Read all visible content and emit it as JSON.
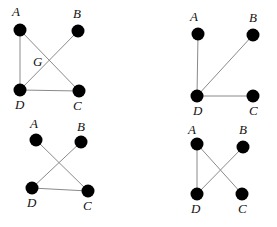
{
  "diagram": {
    "type": "graph-panels",
    "colors": {
      "node": "#000000",
      "edge": "#8a8a8a",
      "label": "#111111",
      "background": "#ffffff"
    },
    "panels": [
      {
        "id": "panel-1",
        "nodes": [
          {
            "id": "A",
            "label": "A",
            "x": 20,
            "y": 30,
            "lx": 12,
            "ly": 16
          },
          {
            "id": "B",
            "label": "B",
            "x": 78,
            "y": 31,
            "lx": 73,
            "ly": 18
          },
          {
            "id": "D",
            "label": "D",
            "x": 20,
            "y": 90,
            "lx": 15,
            "ly": 109
          },
          {
            "id": "C",
            "label": "C",
            "x": 79,
            "y": 91,
            "lx": 73,
            "ly": 110
          }
        ],
        "edges": [
          [
            "A",
            "D"
          ],
          [
            "A",
            "C"
          ],
          [
            "B",
            "D"
          ],
          [
            "D",
            "C"
          ]
        ],
        "extra_labels": [
          {
            "text": "G",
            "x": 33,
            "y": 66
          }
        ]
      },
      {
        "id": "panel-2",
        "nodes": [
          {
            "id": "A",
            "label": "A",
            "x": 198,
            "y": 34,
            "lx": 190,
            "ly": 21
          },
          {
            "id": "B",
            "label": "B",
            "x": 253,
            "y": 35,
            "lx": 249,
            "ly": 22
          },
          {
            "id": "D",
            "label": "D",
            "x": 197,
            "y": 96,
            "lx": 193,
            "ly": 115
          },
          {
            "id": "C",
            "label": "C",
            "x": 253,
            "y": 96,
            "lx": 249,
            "ly": 115
          }
        ],
        "edges": [
          [
            "A",
            "D"
          ],
          [
            "B",
            "D"
          ],
          [
            "D",
            "C"
          ]
        ],
        "extra_labels": []
      },
      {
        "id": "panel-3",
        "nodes": [
          {
            "id": "A",
            "label": "A",
            "x": 36,
            "y": 140,
            "lx": 30,
            "ly": 128
          },
          {
            "id": "B",
            "label": "B",
            "x": 81,
            "y": 142,
            "lx": 77,
            "ly": 131
          },
          {
            "id": "D",
            "label": "D",
            "x": 32,
            "y": 188,
            "lx": 27,
            "ly": 207
          },
          {
            "id": "C",
            "label": "C",
            "x": 88,
            "y": 191,
            "lx": 83,
            "ly": 210
          }
        ],
        "edges": [
          [
            "A",
            "C"
          ],
          [
            "B",
            "D"
          ],
          [
            "D",
            "C"
          ]
        ],
        "extra_labels": []
      },
      {
        "id": "panel-4",
        "nodes": [
          {
            "id": "A",
            "label": "A",
            "x": 197,
            "y": 144,
            "lx": 188,
            "ly": 134
          },
          {
            "id": "B",
            "label": "B",
            "x": 243,
            "y": 147,
            "lx": 239,
            "ly": 134
          },
          {
            "id": "D",
            "label": "D",
            "x": 197,
            "y": 194,
            "lx": 191,
            "ly": 213
          },
          {
            "id": "C",
            "label": "C",
            "x": 242,
            "y": 194,
            "lx": 238,
            "ly": 213
          }
        ],
        "edges": [
          [
            "A",
            "D"
          ],
          [
            "A",
            "C"
          ],
          [
            "B",
            "D"
          ]
        ],
        "extra_labels": []
      }
    ]
  }
}
